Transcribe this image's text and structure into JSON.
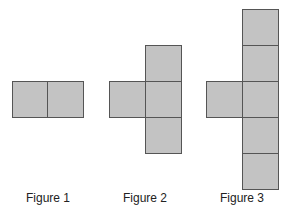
{
  "figures": [
    {
      "label": "Figure 1",
      "squares": 2
    },
    {
      "label": "Figure 2",
      "squares": 4
    },
    {
      "label": "Figure 3",
      "squares": 6
    }
  ],
  "colors": {
    "square_fill": "#c3c3c3",
    "square_border": "#555555"
  }
}
